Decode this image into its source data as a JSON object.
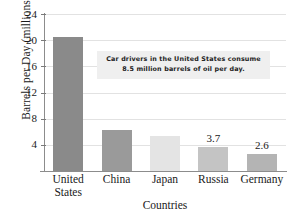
{
  "chart_data": {
    "type": "bar",
    "title": "",
    "xlabel": "Countries",
    "ylabel": "Barrels per Day (millions)",
    "categories": [
      "United States",
      "China",
      "Japan",
      "Russia",
      "Germany"
    ],
    "category_lines": [
      [
        "United",
        "States"
      ],
      [
        "China"
      ],
      [
        "Japan"
      ],
      [
        "Russia"
      ],
      [
        "Germany"
      ]
    ],
    "values": [
      20.5,
      6.2,
      5.3,
      3.7,
      2.6
    ],
    "value_labels": [
      "",
      "",
      "",
      "3.7",
      "2.6"
    ],
    "bar_colors": [
      "#8a8a8a",
      "#9a9a9a",
      "#e4e4e4",
      "#c4c4c4",
      "#b4b4b4"
    ],
    "ylim": [
      0,
      24
    ],
    "yticks": [
      4,
      8,
      12,
      16,
      20,
      24
    ],
    "ytick_labels": [
      "4",
      "8",
      "12",
      "16",
      "20",
      "24"
    ],
    "grid": true,
    "legend": "none",
    "annotations": [
      {
        "line1": "Car drivers in the United States consume",
        "line2": "8.5 million barrels of oil per day.",
        "background": "#efefef"
      }
    ]
  },
  "top_caption": "",
  "colors": {
    "axis": "#8c8c8c",
    "grid": "#e2e2e2",
    "text": "#1a1a1a",
    "annotation_bg": "#efefef"
  }
}
